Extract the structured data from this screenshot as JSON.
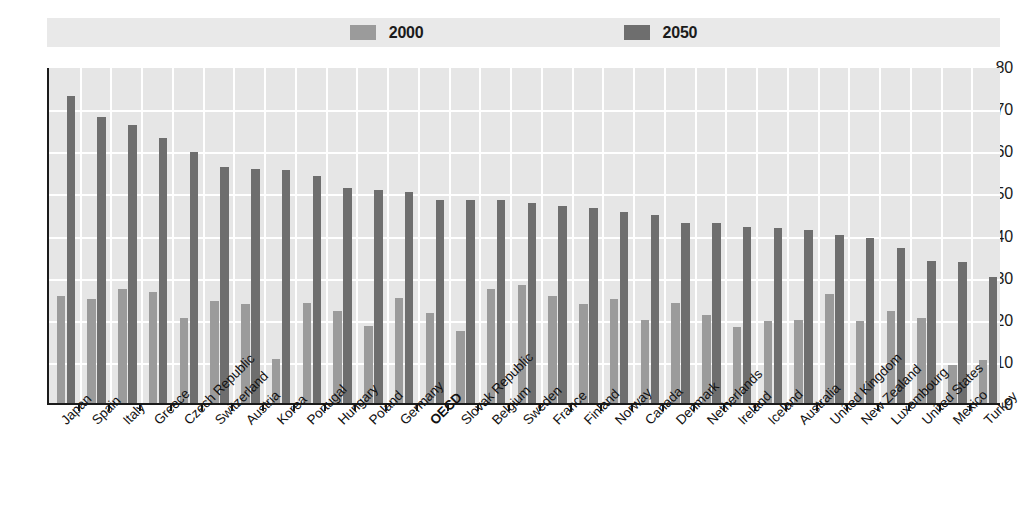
{
  "legend": {
    "position": "top-center",
    "entries": [
      {
        "label": "2000",
        "color": "#9b9b9b"
      },
      {
        "label": "2050",
        "color": "#6e6e6e"
      }
    ]
  },
  "axis": {
    "y_ticks": [
      "0",
      "10",
      "20",
      "30",
      "40",
      "50",
      "60",
      "70",
      "80"
    ]
  },
  "chart_data": {
    "type": "bar",
    "title": "",
    "subtitle": "",
    "xlabel": "",
    "ylabel": "",
    "ylim": [
      0,
      80
    ],
    "ytick_step": 10,
    "grid": true,
    "legend_position": "top-center",
    "highlight_category": "OECD",
    "categories": [
      "Japan",
      "Spain",
      "Italy",
      "Greece",
      "Czech Republic",
      "Switzerland",
      "Austria",
      "Korea",
      "Portugal",
      "Hungary",
      "Poland",
      "Germany",
      "OECD",
      "Slovak Republic",
      "Belgium",
      "Sweden",
      "France",
      "Finland",
      "Norway",
      "Canada",
      "Denmark",
      "Netherlands",
      "Ireland",
      "Iceland",
      "Australia",
      "United Kingdom",
      "New Zealand",
      "Luxembourg",
      "United States",
      "Mexico",
      "Turkey"
    ],
    "series": [
      {
        "name": "2000",
        "color": "#9b9b9b",
        "values": [
          25.5,
          24.7,
          27.0,
          26.3,
          20.2,
          24.3,
          23.4,
          10.5,
          23.7,
          21.8,
          18.3,
          24.9,
          21.3,
          17.2,
          27.0,
          28.0,
          25.4,
          23.4,
          24.8,
          19.7,
          23.8,
          21.0,
          18.0,
          19.4,
          19.8,
          25.8,
          19.4,
          21.8,
          20.2,
          9.0,
          10.1
        ]
      },
      {
        "name": "2050",
        "color": "#6e6e6e",
        "values": [
          72.8,
          67.9,
          65.9,
          63.0,
          59.6,
          56.0,
          55.6,
          55.4,
          54.0,
          51.0,
          50.5,
          50.0,
          48.3,
          48.1,
          48.3,
          47.6,
          46.7,
          46.4,
          45.4,
          44.7,
          42.8,
          42.8,
          41.7,
          41.5,
          41.0,
          40.0,
          39.2,
          36.8,
          33.8,
          33.4,
          30.0
        ]
      }
    ]
  }
}
